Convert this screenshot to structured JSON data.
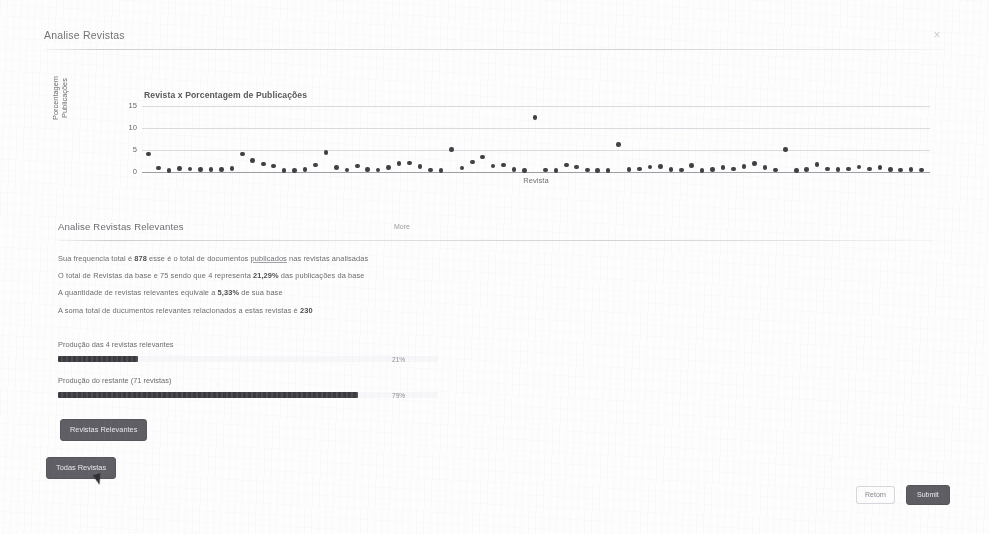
{
  "modal": {
    "title": "Analise Revistas",
    "close_icon": "close-icon",
    "close_glyph": "×"
  },
  "chart_data": {
    "type": "scatter",
    "title": "Revista x Porcentagem de Publicações",
    "xlabel": "Revista",
    "ylabel": "Porcentagem\nPublicações",
    "ylim": [
      0,
      16
    ],
    "yticks": [
      0,
      5,
      10,
      15
    ],
    "ytick_labels": [
      "0",
      "5",
      "10",
      "15"
    ],
    "grid": true,
    "xlim": [
      0,
      76
    ],
    "xtick_labels": [],
    "legend": "none",
    "point_color": "#3f3f44",
    "values": [
      4.1,
      0.9,
      0.4,
      0.8,
      0.7,
      0.6,
      0.6,
      0.6,
      0.8,
      4.1,
      2.6,
      1.8,
      1.4,
      0.4,
      0.3,
      0.6,
      1.6,
      4.4,
      1.0,
      0.5,
      1.4,
      0.6,
      0.5,
      1.0,
      1.9,
      2.1,
      1.3,
      0.5,
      0.4,
      5.2,
      0.9,
      2.3,
      3.4,
      1.4,
      1.6,
      0.6,
      0.4,
      12.4,
      0.5,
      0.4,
      1.6,
      1.1,
      0.5,
      0.3,
      0.4,
      6.3,
      0.6,
      0.7,
      1.1,
      1.2,
      0.6,
      0.5,
      1.5,
      0.3,
      0.6,
      1.0,
      0.7,
      1.3,
      1.9,
      1.0,
      0.5,
      5.1,
      0.4,
      0.6,
      1.7,
      0.7,
      0.6,
      0.7,
      1.1,
      0.7,
      1.0,
      0.6,
      0.5,
      0.6,
      0.5
    ]
  },
  "panel": {
    "title": "Analise Revistas Relevantes",
    "more_label": "More",
    "stats": [
      {
        "prefix": "Sua frequencia total é ",
        "strong": "878",
        "mid": " esse é o total de documentos ",
        "link": "publicados",
        "suffix": " nas revistas analisadas"
      },
      {
        "prefix": "O total de Revistas da base e 75 sendo que 4 representa ",
        "strong": "21,29%",
        "mid": "",
        "link": "",
        "suffix": " das publicações da base"
      },
      {
        "prefix": "A quantidade de revistas relevantes equivale a ",
        "strong": "5,33%",
        "mid": "",
        "link": "",
        "suffix": " de sua base"
      },
      {
        "prefix": "A soma total de ducumentos relevantes relacionados a estas revistas é ",
        "strong": "230",
        "mid": "",
        "link": "",
        "suffix": ""
      }
    ],
    "bars": [
      {
        "label": "Produção das 4 revistas relevantes",
        "pct_label": "21%",
        "value": 21
      },
      {
        "label": "Produção do restante (71 revistas)",
        "pct_label": "79%",
        "value": 79
      }
    ],
    "buttons": {
      "revistas_relevantes": "Revistas Relevantes",
      "todas_revistas": "Todas Revistas"
    }
  },
  "footer": {
    "back_label": "Retorn",
    "submit_label": "Submit"
  }
}
